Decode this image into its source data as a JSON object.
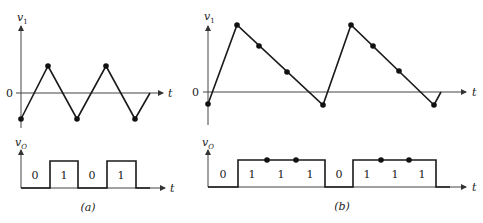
{
  "panels": [
    {
      "id": "a",
      "caption": "(a)",
      "top": {
        "ylabel": "v",
        "ylabel_sub": "1",
        "xlabel": "t",
        "zero_label": "0",
        "waveform": "triangle"
      },
      "bottom": {
        "ylabel": "v",
        "ylabel_sub": "O",
        "xlabel": "t",
        "bits": [
          "0",
          "1",
          "0",
          "1"
        ]
      }
    },
    {
      "id": "b",
      "caption": "(b)",
      "top": {
        "ylabel": "v",
        "ylabel_sub": "1",
        "xlabel": "t",
        "zero_label": "0",
        "waveform": "sawtooth"
      },
      "bottom": {
        "ylabel": "v",
        "ylabel_sub": "O",
        "xlabel": "t",
        "bits": [
          "0",
          "1",
          "1",
          "1",
          "0",
          "1",
          "1",
          "1"
        ]
      }
    }
  ],
  "colors": {
    "line": "#1a1a1a",
    "axis": "#444444"
  }
}
